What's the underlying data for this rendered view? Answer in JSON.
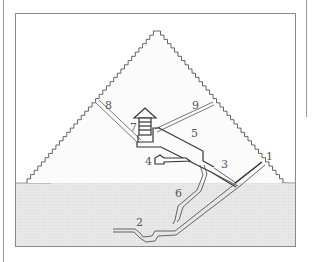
{
  "diagram": {
    "colors": {
      "background": "#ffffff",
      "frame": "#8a8a8a",
      "pyramid_fill": "#fafafa",
      "pyramid_outline": "#666666",
      "ground_fill": "#e6e6e6",
      "passage_outline": "#444444",
      "label": "#555555"
    },
    "labels": [
      {
        "id": "1",
        "text": "1",
        "x": 237,
        "y": 160
      },
      {
        "id": "2",
        "text": "2",
        "x": 136,
        "y": 226
      },
      {
        "id": "3",
        "text": "3",
        "x": 223,
        "y": 168
      },
      {
        "id": "4",
        "text": "4",
        "x": 144,
        "y": 164
      },
      {
        "id": "5",
        "text": "5",
        "x": 192,
        "y": 136
      },
      {
        "id": "6",
        "text": "6",
        "x": 177,
        "y": 197
      },
      {
        "id": "7",
        "text": "7",
        "x": 130,
        "y": 130
      },
      {
        "id": "8",
        "text": "8",
        "x": 105,
        "y": 108
      },
      {
        "id": "9",
        "text": "9",
        "x": 192,
        "y": 108
      }
    ]
  }
}
